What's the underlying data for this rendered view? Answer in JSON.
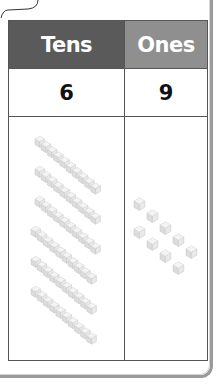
{
  "chart": {
    "headers": [
      {
        "label": "Tens",
        "color": "#5a5a5a"
      },
      {
        "label": "Ones",
        "color": "#8f8f8f"
      }
    ],
    "values": {
      "tens": "6",
      "ones": "9"
    },
    "blocks": {
      "tens_rods": 6,
      "unit_cubes_per_rod": 10,
      "ones_cubes": 9
    }
  },
  "chart_data": {
    "type": "table",
    "columns": [
      "Tens",
      "Ones"
    ],
    "rows": [
      [
        "6",
        "9"
      ]
    ],
    "models": {
      "tens_rods": 6,
      "ones_cubes": 9
    },
    "number": 69
  }
}
